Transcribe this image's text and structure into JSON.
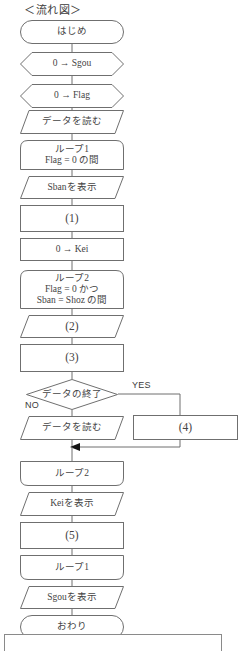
{
  "diagram": {
    "title": "＜流れ図＞",
    "type": "flowchart",
    "language": "ja",
    "branch_labels": {
      "yes": "YES",
      "no": "NO"
    },
    "nodes": [
      {
        "id": "start",
        "shape": "terminator",
        "lines": [
          "はじめ"
        ]
      },
      {
        "id": "init-sgou",
        "shape": "preparation",
        "lines": [
          "0 → Sgou"
        ]
      },
      {
        "id": "init-flag",
        "shape": "preparation",
        "lines": [
          "0 → Flag"
        ]
      },
      {
        "id": "read-data-1",
        "shape": "io",
        "lines": [
          "データを読む"
        ]
      },
      {
        "id": "loop1-start",
        "shape": "loop-start",
        "lines": [
          "ループ1",
          "Flag = 0 の間"
        ]
      },
      {
        "id": "print-sban",
        "shape": "io",
        "lines": [
          "Sbanを表示"
        ]
      },
      {
        "id": "blank-1",
        "shape": "process",
        "lines": [
          "(1)"
        ]
      },
      {
        "id": "init-kei",
        "shape": "process",
        "lines": [
          "0 → Kei"
        ]
      },
      {
        "id": "loop2-start",
        "shape": "loop-start",
        "lines": [
          "ループ2",
          "Flag = 0 かつ",
          "Sban = Shoz の間"
        ]
      },
      {
        "id": "blank-2",
        "shape": "io",
        "lines": [
          "(2)"
        ]
      },
      {
        "id": "blank-3",
        "shape": "process",
        "lines": [
          "(3)"
        ]
      },
      {
        "id": "decision-eof",
        "shape": "decision",
        "lines": [
          "データの終了"
        ]
      },
      {
        "id": "read-data-2",
        "shape": "io",
        "lines": [
          "データを読む"
        ]
      },
      {
        "id": "blank-4",
        "shape": "process",
        "lines": [
          "(4)"
        ]
      },
      {
        "id": "loop2-end",
        "shape": "loop-end",
        "lines": [
          "ループ2"
        ]
      },
      {
        "id": "print-kei",
        "shape": "io",
        "lines": [
          "Keiを表示"
        ]
      },
      {
        "id": "blank-5",
        "shape": "process",
        "lines": [
          "(5)"
        ]
      },
      {
        "id": "loop1-end",
        "shape": "loop-end",
        "lines": [
          "ループ1"
        ]
      },
      {
        "id": "print-sgou",
        "shape": "io",
        "lines": [
          "Sgouを表示"
        ]
      },
      {
        "id": "end",
        "shape": "terminator",
        "lines": [
          "おわり"
        ]
      }
    ]
  }
}
